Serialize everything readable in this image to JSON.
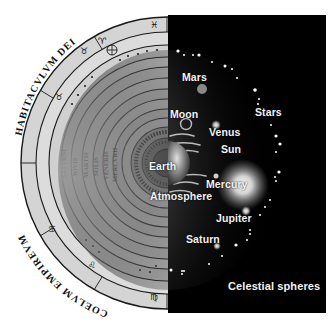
{
  "diagram": {
    "type": "comparison-illustration",
    "left_half": {
      "style": "historical woodcut (geocentric cosmos)",
      "outer_inscriptions": [
        "HABITACVLVM DEI",
        "COELVM EMPIREVM"
      ],
      "ring_labels": [
        "SATVRNI",
        "IOVIS",
        "MARTIS",
        "SOLIS",
        "VENERIS",
        "MERCVRII"
      ]
    },
    "right_half": {
      "style": "modern artwork on black",
      "labels": {
        "mars": "Mars",
        "moon": "Moon",
        "stars": "Stars",
        "venus": "Venus",
        "sun": "Sun",
        "earth": "Earth",
        "mercury": "Mercury",
        "atmosphere": "Atmosphere",
        "jupiter": "Jupiter",
        "saturn": "Saturn",
        "celestial_spheres": "Celestial spheres"
      }
    },
    "colors": {
      "panel_background": "#000000",
      "woodcut_paper": "#d9d9d9",
      "woodcut_ink": "#1a1a1a",
      "label_text": "#f2f2f2"
    }
  }
}
